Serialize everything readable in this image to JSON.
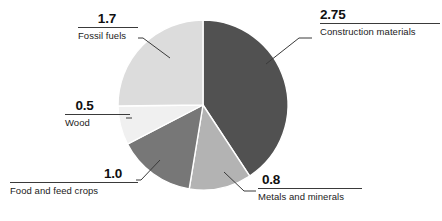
{
  "chart_data": {
    "type": "pie",
    "title": "",
    "subtitle": "",
    "xlabel": "",
    "ylabel": "",
    "legend_position": "none",
    "grid": false,
    "total": 6.75,
    "units": "",
    "start_angle_deg": 0,
    "direction": "clockwise",
    "categories": [
      "Construction materials",
      "Metals and minerals",
      "Food and feed crops",
      "Wood",
      "Fossil fuels"
    ],
    "values": [
      2.75,
      0.8,
      1.0,
      0.5,
      1.7
    ],
    "value_labels": [
      "2.75",
      "0.8",
      "1.0",
      "0.5",
      "1.7"
    ],
    "colors": [
      "#515151",
      "#b3b3b3",
      "#777777",
      "#f0f0f0",
      "#dcdcdc"
    ],
    "slices": [
      {
        "label": "Construction materials",
        "value": 2.75,
        "value_label": "2.75",
        "color": "#515151",
        "start_deg": 0,
        "end_deg": 146.67
      },
      {
        "label": "Metals and minerals",
        "value": 0.8,
        "value_label": "0.8",
        "color": "#b3b3b3",
        "start_deg": 146.67,
        "end_deg": 189.33
      },
      {
        "label": "Food and feed crops",
        "value": 1.0,
        "value_label": "1.0",
        "color": "#777777",
        "start_deg": 189.33,
        "end_deg": 242.67
      },
      {
        "label": "Wood",
        "value": 0.5,
        "value_label": "0.5",
        "color": "#f0f0f0",
        "start_deg": 242.67,
        "end_deg": 269.33
      },
      {
        "label": "Fossil fuels",
        "value": 1.7,
        "value_label": "1.7",
        "color": "#dcdcdc",
        "start_deg": 269.33,
        "end_deg": 360
      }
    ]
  },
  "callouts": {
    "construction": {
      "value": "2.75",
      "name": "Construction materials"
    },
    "fossil": {
      "value": "1.7",
      "name": "Fossil fuels"
    },
    "wood": {
      "value": "0.5",
      "name": "Wood"
    },
    "food": {
      "value": "1.0",
      "name": "Food and feed crops"
    },
    "metals": {
      "value": "0.8",
      "name": "Metals and minerals"
    }
  },
  "style": {
    "background": "#ffffff",
    "leader_line_color": "#3a3a3a",
    "slice_divider_color": "#ffffff",
    "text_color": "#101010"
  }
}
